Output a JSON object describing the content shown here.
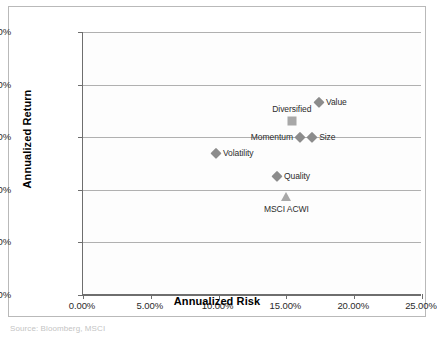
{
  "chart_data": {
    "type": "scatter",
    "title": "",
    "xlabel": "Annualized Risk",
    "ylabel": "Annualized Return",
    "xlim": [
      0,
      25
    ],
    "ylim": [
      0,
      15
    ],
    "grid": true,
    "legend": "none",
    "value_format": "percent",
    "xticks": [
      "0.00%",
      "5.00%",
      "10.00%",
      "15.00%",
      "20.00%",
      "25.00%"
    ],
    "xtick_values": [
      0,
      5,
      10,
      15,
      20,
      25
    ],
    "yticks": [
      "0.00%",
      "3.00%",
      "6.00%",
      "9.00%",
      "12.00%",
      "15.00%"
    ],
    "ytick_values": [
      0,
      3,
      6,
      9,
      12,
      15
    ],
    "points": [
      {
        "name": "Value",
        "label": "Value",
        "x": 17.4,
        "y": 11.0,
        "marker": "diamond",
        "color": "#8c8c8c",
        "label_position": "right"
      },
      {
        "name": "Diversified",
        "label": "Diversified",
        "x": 15.4,
        "y": 9.9,
        "marker": "square",
        "color": "#a8a8a8",
        "label_position": "above"
      },
      {
        "name": "Momentum",
        "label": "Momentum",
        "x": 16.0,
        "y": 9.0,
        "marker": "diamond",
        "color": "#8c8c8c",
        "label_position": "left"
      },
      {
        "name": "Size",
        "label": "Size",
        "x": 16.9,
        "y": 9.0,
        "marker": "diamond",
        "color": "#8c8c8c",
        "label_position": "right"
      },
      {
        "name": "Volatility",
        "label": "Volatility",
        "x": 9.8,
        "y": 8.1,
        "marker": "diamond",
        "color": "#8c8c8c",
        "label_position": "right"
      },
      {
        "name": "Quality",
        "label": "Quality",
        "x": 14.3,
        "y": 6.8,
        "marker": "diamond",
        "color": "#8c8c8c",
        "label_position": "right"
      },
      {
        "name": "MSCI ACWI",
        "label": "MSCI ACWI",
        "x": 15.0,
        "y": 5.6,
        "marker": "triangle",
        "color": "#a8a8a8",
        "label_position": "below"
      }
    ]
  },
  "caption": {
    "text": "Source: Bloomberg, MSCI"
  }
}
